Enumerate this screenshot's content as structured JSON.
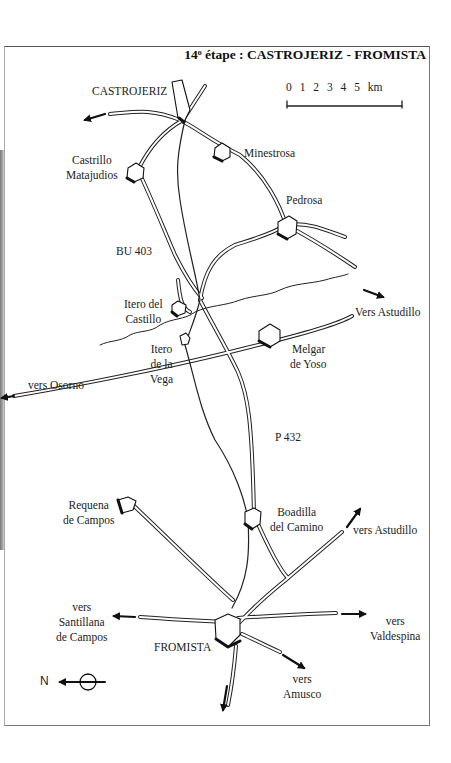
{
  "title": "14ᵒ étape : CASTROJERIZ - FROMISTA",
  "scale": {
    "ticks": "0 1 2 3 4 5 km"
  },
  "north_label": "N",
  "towns": {
    "castrojeriz": "CASTROJERIZ",
    "castrillo": [
      "Castrillo",
      "Matajudios"
    ],
    "minestrosa": "Minestrosa",
    "pedrosa": "Pedrosa",
    "itero_castillo": [
      "Itero del",
      "Castillo"
    ],
    "itero_vega": [
      "Itero",
      "de la",
      "Vega"
    ],
    "melgar": [
      "Melgar",
      "de Yoso"
    ],
    "requena": [
      "Requena",
      "de Campos"
    ],
    "boadilla": [
      "Boadilla",
      "del Camino"
    ],
    "fromista": "FROMISTA"
  },
  "roads": {
    "bu403": "BU 403",
    "p432": "P 432"
  },
  "directions": {
    "astudillo_upper": "Vers Astudillo",
    "osorno": "vers Osorno",
    "astudillo_lower": "vers Astudillo",
    "santillana": [
      "vers",
      "Santillana",
      "de Campos"
    ],
    "valdespina": [
      "vers",
      "Valdespina"
    ],
    "amusco": [
      "vers",
      "Amusco"
    ]
  }
}
